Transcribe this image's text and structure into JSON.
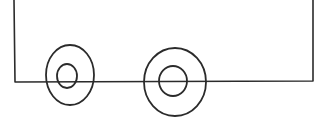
{
  "drawing": {
    "description": "Hand-drawn sketch of a vehicle body with two wheels",
    "stroke_color": "#2b2b2b",
    "background_color": "#ffffff",
    "body": {
      "left_x": 14,
      "right_x": 313,
      "top_y": 0,
      "bottom_y": 82
    },
    "wheels": [
      {
        "label": "front-wheel",
        "outer": {
          "cx": 70,
          "cy": 75,
          "rx": 24,
          "ry": 30
        },
        "inner": {
          "cx": 67,
          "cy": 76,
          "rx": 10,
          "ry": 12
        }
      },
      {
        "label": "rear-wheel",
        "outer": {
          "cx": 175,
          "cy": 82,
          "rx": 31,
          "ry": 34
        },
        "inner": {
          "cx": 173,
          "cy": 81,
          "rx": 14,
          "ry": 15
        }
      }
    ]
  }
}
